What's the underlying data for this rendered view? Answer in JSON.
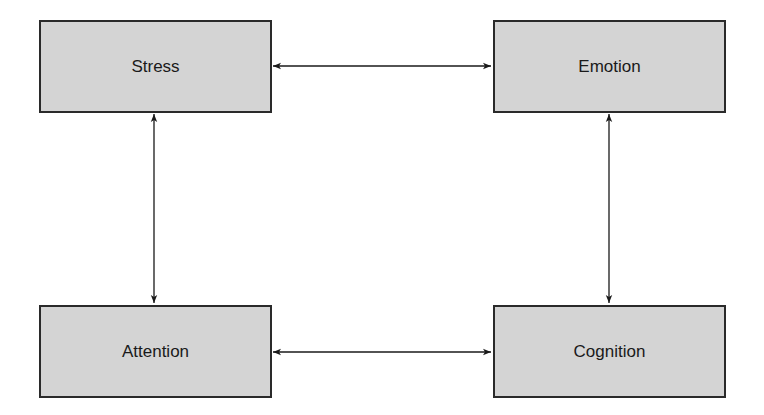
{
  "diagram": {
    "type": "bidirectional-relationship-diagram",
    "nodes": {
      "stress": {
        "label": "Stress"
      },
      "emotion": {
        "label": "Emotion"
      },
      "attention": {
        "label": "Attention"
      },
      "cognition": {
        "label": "Cognition"
      }
    },
    "edges": [
      {
        "from": "Stress",
        "to": "Emotion",
        "direction": "bidirectional"
      },
      {
        "from": "Stress",
        "to": "Attention",
        "direction": "bidirectional"
      },
      {
        "from": "Emotion",
        "to": "Cognition",
        "direction": "bidirectional"
      },
      {
        "from": "Attention",
        "to": "Cognition",
        "direction": "bidirectional"
      }
    ],
    "colors": {
      "node_fill": "#d4d4d4",
      "node_border": "#2a2a2a",
      "edge": "#1a1a1a",
      "background": "#ffffff"
    }
  }
}
